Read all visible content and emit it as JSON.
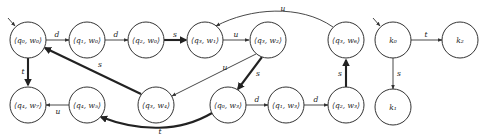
{
  "diagram": {
    "type": "automaton-product-graph",
    "nodes": [
      {
        "id": "q0w0",
        "label": "⟨q₀, w₀⟩",
        "x": 28,
        "y": 40,
        "initial": true
      },
      {
        "id": "q1w0",
        "label": "⟨q₁, w₀⟩",
        "x": 87,
        "y": 40
      },
      {
        "id": "q2w0",
        "label": "⟨q₂, w₀⟩",
        "x": 146,
        "y": 40
      },
      {
        "id": "q3w1",
        "label": "⟨q₃, w₁⟩",
        "x": 205,
        "y": 40
      },
      {
        "id": "q3w2",
        "label": "⟨q₃, w₂⟩",
        "x": 268,
        "y": 40
      },
      {
        "id": "q3w6",
        "label": "⟨q₃, w₆⟩",
        "x": 346,
        "y": 40
      },
      {
        "id": "q4w7",
        "label": "⟨q₄, w₇⟩",
        "x": 28,
        "y": 105
      },
      {
        "id": "q4w5",
        "label": "⟨q₄, w₅⟩",
        "x": 87,
        "y": 105
      },
      {
        "id": "q3w4",
        "label": "⟨q₃, w₄⟩",
        "x": 156,
        "y": 105
      },
      {
        "id": "q0w3",
        "label": "⟨q₀, w₃⟩",
        "x": 228,
        "y": 105
      },
      {
        "id": "q1w3",
        "label": "⟨q₁, w₃⟩",
        "x": 286,
        "y": 105
      },
      {
        "id": "q2w3",
        "label": "⟨q₂, w₃⟩",
        "x": 346,
        "y": 105
      },
      {
        "id": "k0",
        "label": "k₀",
        "x": 393,
        "y": 40,
        "initial": true
      },
      {
        "id": "k2",
        "label": "k₂",
        "x": 460,
        "y": 40
      },
      {
        "id": "k1",
        "label": "k₁",
        "x": 393,
        "y": 107
      }
    ],
    "edges": [
      {
        "from": "q0w0",
        "to": "q1w0",
        "label": "d",
        "thick": false
      },
      {
        "from": "q1w0",
        "to": "q2w0",
        "label": "d",
        "thick": false
      },
      {
        "from": "q2w0",
        "to": "q3w1",
        "label": "s",
        "thick": true
      },
      {
        "from": "q3w1",
        "to": "q3w2",
        "label": "u",
        "thick": false
      },
      {
        "from": "q3w6",
        "to": "q3w1",
        "label": "u",
        "thick": false,
        "curved": true
      },
      {
        "from": "q3w2",
        "to": "q3w4",
        "label": "u",
        "thick": false
      },
      {
        "from": "q3w2",
        "to": "q0w3",
        "label": "s",
        "thick": true
      },
      {
        "from": "q3w4",
        "to": "q0w0",
        "label": "s",
        "thick": true
      },
      {
        "from": "q0w0",
        "to": "q4w7",
        "label": "t",
        "thick": true
      },
      {
        "from": "q4w5",
        "to": "q4w7",
        "label": "u",
        "thick": false
      },
      {
        "from": "q0w3",
        "to": "q4w5",
        "label": "t",
        "thick": true,
        "curved": true
      },
      {
        "from": "q0w3",
        "to": "q1w3",
        "label": "d",
        "thick": false
      },
      {
        "from": "q1w3",
        "to": "q2w3",
        "label": "d",
        "thick": false
      },
      {
        "from": "q2w3",
        "to": "q3w6",
        "label": "s",
        "thick": true
      },
      {
        "from": "k0",
        "to": "k2",
        "label": "t",
        "thick": false
      },
      {
        "from": "k0",
        "to": "k1",
        "label": "s",
        "thick": false
      }
    ],
    "edge_labels": {
      "d1": "d",
      "d2": "d",
      "s_q2w0_q3w1": "s",
      "u_q3w1_q3w2": "u",
      "u_top": "u",
      "u_q3w2_q3w4": "u",
      "s_q3w2_q0w3": "s",
      "s_q3w4_q0w0": "s",
      "t_q0w0_q4w7": "t",
      "u_q4w5_q4w7": "u",
      "t_bottom": "t",
      "d3": "d",
      "d4": "d",
      "s_q2w3_q3w6": "s",
      "t_k0_k2": "t",
      "s_k0_k1": "s"
    }
  }
}
